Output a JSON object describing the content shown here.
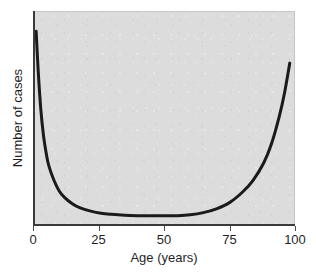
{
  "chart_data": {
    "type": "line",
    "title": "",
    "xlabel": "Age (years)",
    "ylabel": "Number of cases",
    "xlim": [
      0,
      100
    ],
    "ylim": [
      0,
      100
    ],
    "grid": false,
    "legend": "none",
    "xticks": [
      {
        "value": 0,
        "label": "0"
      },
      {
        "value": 25,
        "label": "25"
      },
      {
        "value": 50,
        "label": "50"
      },
      {
        "value": 75,
        "label": "75"
      },
      {
        "value": 100,
        "label": "100"
      }
    ],
    "yticks": [],
    "series": [
      {
        "name": "Number of cases by age",
        "color": "#1a1a1a",
        "line_width": 3,
        "x": [
          1.2,
          2,
          3,
          4,
          5,
          6,
          8,
          10,
          12,
          15,
          18,
          22,
          26,
          30,
          35,
          40,
          45,
          50,
          55,
          60,
          65,
          70,
          75,
          80,
          84,
          88,
          91,
          94,
          96,
          98
        ],
        "y": [
          91,
          72,
          54,
          42,
          34,
          28,
          21,
          16,
          13,
          10,
          8,
          6.5,
          5.5,
          5,
          4.6,
          4.4,
          4.3,
          4.3,
          4.4,
          4.8,
          5.8,
          7.6,
          10.5,
          15.5,
          21,
          29,
          38,
          51,
          62,
          76
        ]
      }
    ],
    "annotations": []
  },
  "style": {
    "plot_background": "#dcdcdc",
    "page_background": "#ffffff",
    "axis_color": "#3a3a3a",
    "curve_color": "#1a1a1a"
  }
}
